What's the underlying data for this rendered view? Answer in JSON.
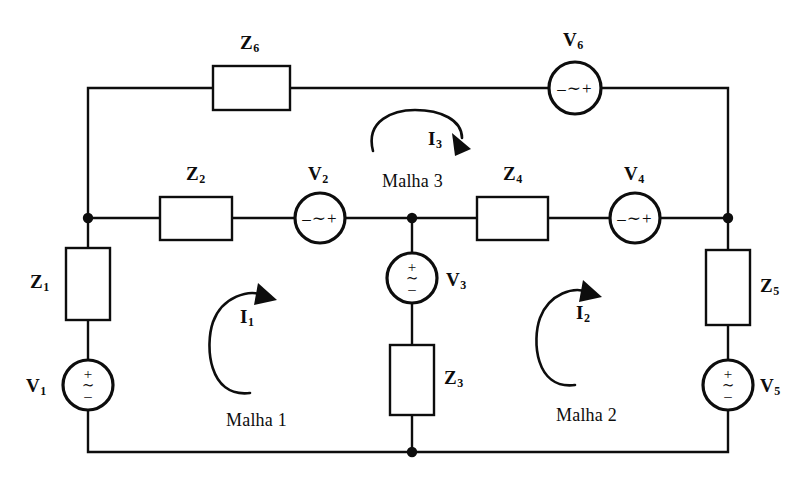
{
  "figure": {
    "type": "circuit-schematic",
    "title": "",
    "language": "pt",
    "background_color": "#ffffff",
    "line_color": "#0d0d0d"
  },
  "impedances": [
    {
      "id": "Z1",
      "label": "Z",
      "sub": "1",
      "orientation": "vertical",
      "branch": "left-vertical"
    },
    {
      "id": "Z2",
      "label": "Z",
      "sub": "2",
      "orientation": "horizontal",
      "branch": "middle-horizontal-left"
    },
    {
      "id": "Z3",
      "label": "Z",
      "sub": "3",
      "orientation": "vertical",
      "branch": "center-vertical"
    },
    {
      "id": "Z4",
      "label": "Z",
      "sub": "4",
      "orientation": "horizontal",
      "branch": "middle-horizontal-right"
    },
    {
      "id": "Z5",
      "label": "Z",
      "sub": "5",
      "orientation": "vertical",
      "branch": "right-vertical"
    },
    {
      "id": "Z6",
      "label": "Z",
      "sub": "6",
      "orientation": "horizontal",
      "branch": "top-rail"
    }
  ],
  "sources": [
    {
      "id": "V1",
      "label": "V",
      "sub": "1",
      "symbol": "ac-source",
      "polarity": "vertical",
      "marks": [
        "+",
        "~",
        "–"
      ],
      "branch": "left-vertical"
    },
    {
      "id": "V2",
      "label": "V",
      "sub": "2",
      "symbol": "ac-source",
      "polarity": "horizontal",
      "marks": [
        "–",
        "~",
        "+"
      ],
      "branch": "middle-horizontal-left"
    },
    {
      "id": "V3",
      "label": "V",
      "sub": "3",
      "symbol": "ac-source",
      "polarity": "vertical",
      "marks": [
        "+",
        "~",
        "–"
      ],
      "branch": "center-vertical"
    },
    {
      "id": "V4",
      "label": "V",
      "sub": "4",
      "symbol": "ac-source",
      "polarity": "horizontal",
      "marks": [
        "–",
        "~",
        "+"
      ],
      "branch": "middle-horizontal-right"
    },
    {
      "id": "V5",
      "label": "V",
      "sub": "5",
      "symbol": "ac-source",
      "polarity": "vertical",
      "marks": [
        "+",
        "~",
        "–"
      ],
      "branch": "right-vertical"
    },
    {
      "id": "V6",
      "label": "V",
      "sub": "6",
      "symbol": "ac-source",
      "polarity": "horizontal",
      "marks": [
        "–",
        "~",
        "+"
      ],
      "branch": "top-rail"
    }
  ],
  "mesh_currents": [
    {
      "id": "I1",
      "label": "I",
      "sub": "1",
      "direction": "clockwise",
      "mesh_label": "Malha 1"
    },
    {
      "id": "I2",
      "label": "I",
      "sub": "2",
      "direction": "clockwise",
      "mesh_label": "Malha 2"
    },
    {
      "id": "I3",
      "label": "I",
      "sub": "3",
      "direction": "clockwise",
      "mesh_label": "Malha 3"
    }
  ],
  "mesh_labels": [
    {
      "id": "malha1",
      "text": "Malha 1"
    },
    {
      "id": "malha2",
      "text": "Malha 2"
    },
    {
      "id": "malha3",
      "text": "Malha 3"
    }
  ],
  "nodes": [
    {
      "id": "node-left",
      "x": 88,
      "y": 218
    },
    {
      "id": "node-center",
      "x": 412,
      "y": 218
    },
    {
      "id": "node-right",
      "x": 728,
      "y": 218
    },
    {
      "id": "node-bottom-center",
      "x": 412,
      "y": 452
    }
  ]
}
